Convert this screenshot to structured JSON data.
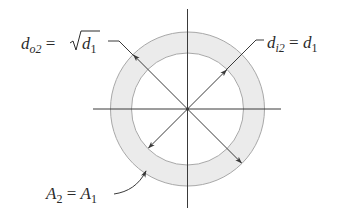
{
  "diagram": {
    "labels": {
      "outer_diameter": {
        "main": "d",
        "sub": "o2",
        "eq": " = ",
        "root_var": "d",
        "root_sub": "1"
      },
      "inner_diameter": {
        "main": "d",
        "sub": "i2",
        "eq": " = ",
        "rhs": "d",
        "rhs_sub": "1"
      },
      "area": {
        "main": "A",
        "sub": "2",
        "eq": " = ",
        "rhs": "A",
        "rhs_sub": "1"
      }
    },
    "colors": {
      "ring_fill": "#ebebeb",
      "ring_stroke": "#a8a8a8",
      "line": "#3a3a3a",
      "text": "#2a2a2a"
    }
  }
}
